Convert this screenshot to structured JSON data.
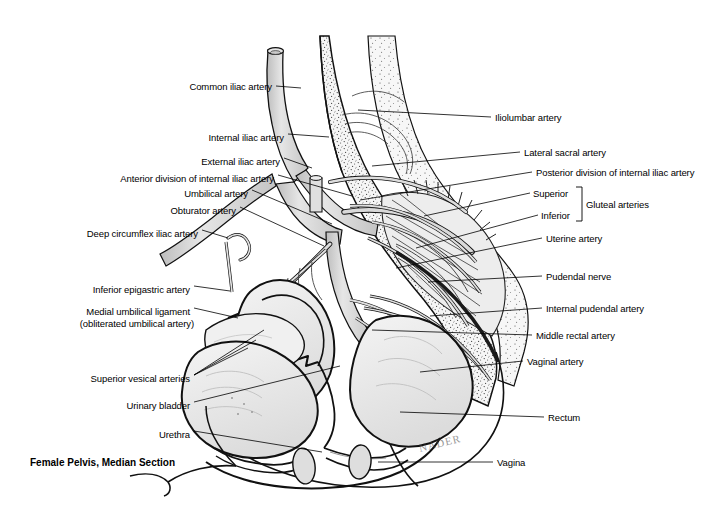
{
  "figure": {
    "title": "Female Pelvis, Median Section",
    "signature": "NADER",
    "domain": "anatomical-illustration",
    "style": "grayscale line-and-stipple medical illustration",
    "background_color": "#ffffff",
    "ink_color": "#000000",
    "vessel_fill": "#d8d8d8",
    "bone_fill": "#f2f2f2",
    "organ_fill": "#ececec"
  },
  "labels_left": [
    {
      "id": "common-iliac-artery",
      "text": "Common iliac artery",
      "x": 272,
      "y": 86,
      "tip_x": 301,
      "tip_y": 88
    },
    {
      "id": "internal-iliac-artery",
      "text": "Internal iliac artery",
      "x": 284,
      "y": 137,
      "tip_x": 327,
      "tip_y": 137
    },
    {
      "id": "external-iliac-artery",
      "text": "External iliac artery",
      "x": 280,
      "y": 161,
      "tip_x": 312,
      "tip_y": 167
    },
    {
      "id": "anterior-division",
      "text": "Anterior division of internal iliac artery",
      "x": 274,
      "y": 178,
      "tip_x": 348,
      "tip_y": 193
    },
    {
      "id": "umbilical-artery",
      "text": "Umbilical artery",
      "x": 248,
      "y": 193,
      "tip_x": 330,
      "tip_y": 222
    },
    {
      "id": "obturator-artery",
      "text": "Obturator artery",
      "x": 236,
      "y": 210,
      "tip_x": 323,
      "tip_y": 243
    },
    {
      "id": "deep-circumflex-iliac",
      "text": "Deep circumflex iliac artery",
      "x": 198,
      "y": 233,
      "tip_x": 222,
      "tip_y": 236
    },
    {
      "id": "inferior-epigastric",
      "text": "Inferior epigastric artery",
      "x": 190,
      "y": 289,
      "tip_x": 225,
      "tip_y": 290
    },
    {
      "id": "medial-umbilical-lig-1",
      "text": "Medial umbilical ligament",
      "x": 190,
      "y": 311,
      "tip_x": 237,
      "tip_y": 317
    },
    {
      "id": "medial-umbilical-lig-2",
      "text": "(obliterated umbilical artery)",
      "x": 190,
      "y": 323,
      "tip_x": null,
      "tip_y": null
    },
    {
      "id": "superior-vesical",
      "text": "Superior vesical arteries",
      "x": 190,
      "y": 378,
      "tip_x": 213,
      "tip_y": 378
    },
    {
      "id": "urinary-bladder",
      "text": "Urinary bladder",
      "x": 190,
      "y": 405,
      "tip_x": 231,
      "tip_y": 406
    },
    {
      "id": "urethra",
      "text": "Urethra",
      "x": 190,
      "y": 434,
      "tip_x": 222,
      "tip_y": 434
    }
  ],
  "labels_right": [
    {
      "id": "iliolumbar-artery",
      "text": "Iliolumbar artery",
      "x": 495,
      "y": 117,
      "tip_x": 487,
      "tip_y": 117
    },
    {
      "id": "lateral-sacral-artery",
      "text": "Lateral sacral artery",
      "x": 524,
      "y": 152,
      "tip_x": 509,
      "tip_y": 152
    },
    {
      "id": "posterior-division",
      "text": "Posterior division of internal iliac artery",
      "x": 536,
      "y": 172,
      "tip_x": 521,
      "tip_y": 172
    },
    {
      "id": "gluteal-superior",
      "text": "Superior",
      "x": 533,
      "y": 193,
      "tip_x": 528,
      "tip_y": 193
    },
    {
      "id": "gluteal-inferior",
      "text": "Inferior",
      "x": 541,
      "y": 215,
      "tip_x": 534,
      "tip_y": 215
    },
    {
      "id": "gluteal-arteries",
      "text": "Gluteal arteries",
      "x": 585,
      "y": 204,
      "tip_x": null,
      "tip_y": null
    },
    {
      "id": "uterine-artery",
      "text": "Uterine artery",
      "x": 546,
      "y": 238,
      "tip_x": 531,
      "tip_y": 238
    },
    {
      "id": "pudendal-nerve",
      "text": "Pudendal nerve",
      "x": 546,
      "y": 276,
      "tip_x": 531,
      "tip_y": 276
    },
    {
      "id": "internal-pudendal",
      "text": "Internal pudendal artery",
      "x": 546,
      "y": 308,
      "tip_x": 531,
      "tip_y": 308
    },
    {
      "id": "middle-rectal-artery",
      "text": "Middle rectal artery",
      "x": 536,
      "y": 335,
      "tip_x": 521,
      "tip_y": 335
    },
    {
      "id": "vaginal-artery",
      "text": "Vaginal artery",
      "x": 527,
      "y": 361,
      "tip_x": 512,
      "tip_y": 361
    },
    {
      "id": "rectum",
      "text": "Rectum",
      "x": 548,
      "y": 417,
      "tip_x": 533,
      "tip_y": 417
    },
    {
      "id": "vagina",
      "text": "Vagina",
      "x": 497,
      "y": 462,
      "tip_x": 482,
      "tip_y": 462
    }
  ],
  "structures": [
    "common iliac artery (cut stump)",
    "internal iliac artery",
    "external iliac artery",
    "anterior division of internal iliac artery",
    "posterior division of internal iliac artery",
    "iliolumbar artery",
    "lateral sacral artery",
    "superior gluteal artery",
    "inferior gluteal artery",
    "umbilical artery",
    "obturator artery",
    "deep circumflex iliac artery",
    "inferior epigastric artery",
    "medial umbilical ligament",
    "superior vesical arteries",
    "uterine artery",
    "vaginal artery",
    "middle rectal artery",
    "internal pudendal artery",
    "pudendal nerve",
    "sacrum",
    "uterus",
    "urinary bladder",
    "urethra",
    "vagina",
    "rectum",
    "pubic bone"
  ]
}
